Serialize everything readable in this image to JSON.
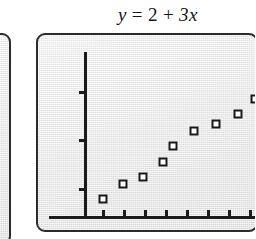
{
  "figure": {
    "title_parts": {
      "y": "y",
      "equals": "=",
      "intercept": "2",
      "plus": "+",
      "slope_term": "3x"
    },
    "title_text": "y = 2 + 3x"
  },
  "colors": {
    "ink": "#1b1b1b",
    "panel_border": "#2b2b2b",
    "screen_fill": "#e9e9e9",
    "marker_fill": "#ffffff",
    "marker_stroke": "#181818",
    "page_background": "#ffffff"
  },
  "panels": {
    "left_partial": {
      "name": "adjacent-calculator-screen",
      "clipped": "true"
    },
    "main": {
      "name": "calculator-screen"
    }
  },
  "chart_data": {
    "type": "scatter",
    "xlabel": "",
    "ylabel": "",
    "equation": "y = 2 + 3x",
    "slope": 3,
    "intercept": 2,
    "grid": false,
    "legend": false,
    "legend_position": "none",
    "xlim": [
      0,
      9
    ],
    "ylim": [
      0,
      29
    ],
    "x": [
      1,
      2,
      3,
      4,
      5,
      6,
      7,
      8
    ],
    "y": [
      5,
      8,
      11,
      14,
      17,
      20,
      23,
      26
    ],
    "series": [
      {
        "name": "data",
        "marker": "square",
        "values": [
          5,
          8,
          11,
          14,
          17,
          20,
          23,
          26
        ]
      }
    ],
    "xticks": [
      1,
      2,
      3,
      4,
      5,
      6,
      7,
      8
    ],
    "xtick_labels": [
      "",
      "",
      "",
      "",
      "",
      "",
      "",
      ""
    ],
    "yticks": [
      10,
      20,
      30
    ],
    "ytick_labels": [
      "",
      "",
      ""
    ]
  },
  "geometry": {
    "axis_y_x": 82,
    "axis_y_top": 50,
    "axis_x_y": 214,
    "axis_x_left": 47,
    "axis_x_right": 255,
    "tick_y_positions": [
      89,
      137,
      186
    ],
    "tick_x_positions": [
      100,
      121,
      142,
      163,
      184,
      205,
      226,
      247
    ],
    "markers": [
      {
        "x": 101,
        "y": 197
      },
      {
        "x": 121,
        "y": 182
      },
      {
        "x": 141,
        "y": 175
      },
      {
        "x": 161,
        "y": 160
      },
      {
        "x": 171,
        "y": 144
      },
      {
        "x": 192,
        "y": 129
      },
      {
        "x": 214,
        "y": 122
      },
      {
        "x": 236,
        "y": 112
      },
      {
        "x": 253,
        "y": 97
      }
    ]
  }
}
